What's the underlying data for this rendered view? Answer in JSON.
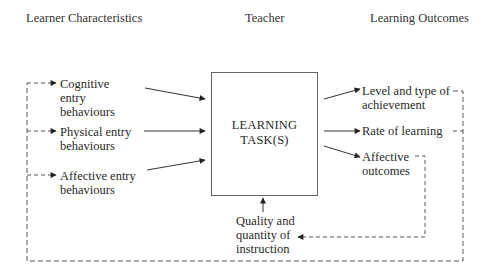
{
  "headers": {
    "left": "Learner Characteristics",
    "center": "Teacher",
    "right": "Learning Outcomes"
  },
  "inputs": [
    {
      "line1": "Cognitive",
      "line2": "entry",
      "line3": "behaviours"
    },
    {
      "line1": "Physical entry",
      "line2": "behaviours"
    },
    {
      "line1": "Affective entry",
      "line2": "behaviours"
    }
  ],
  "center_box": {
    "line1": "LEARNING",
    "line2": "TASK(S)"
  },
  "teacher_input": {
    "line1": "Quality and",
    "line2": "quantity of",
    "line3": "instruction"
  },
  "outputs": [
    {
      "line1": "Level and type of",
      "line2": "achievement"
    },
    {
      "line1": "Rate of learning"
    },
    {
      "line1": "Affective",
      "line2": "outcomes"
    }
  ],
  "colors": {
    "solid_line": "#2a2a2a",
    "dashed_line": "#555555",
    "box_border": "#666666"
  }
}
